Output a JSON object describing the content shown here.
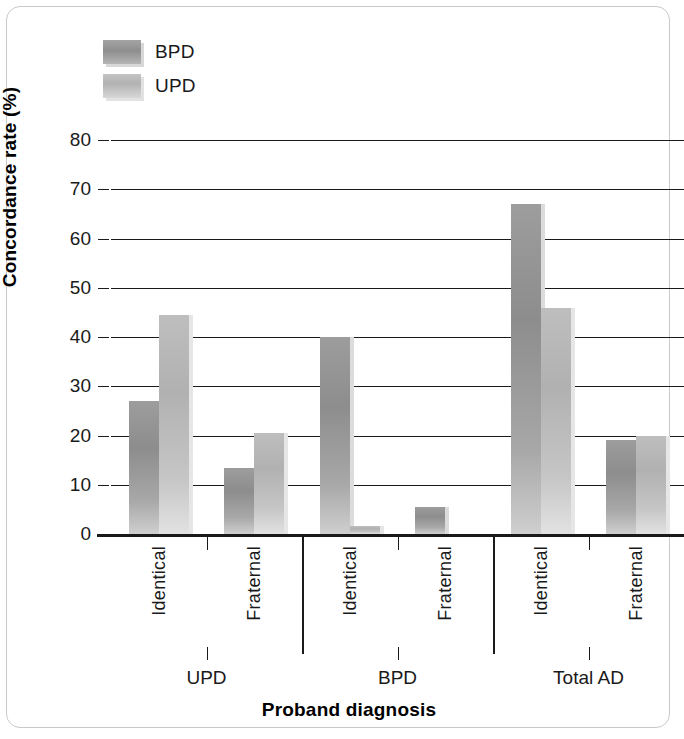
{
  "chart_data": {
    "type": "bar",
    "title": "",
    "xlabel": "Proband diagnosis",
    "ylabel": "Concordance rate (%)",
    "ylim": [
      0,
      80
    ],
    "ytick_step": 10,
    "yticks": [
      80,
      70,
      60,
      50,
      40,
      30,
      20,
      10,
      0
    ],
    "grid": true,
    "legend_position": "top-left",
    "categories": [
      "Identical",
      "Fraternal",
      "Identical",
      "Fraternal",
      "Identical",
      "Fraternal"
    ],
    "groups": [
      {
        "name": "UPD",
        "subcategories": [
          "Identical",
          "Fraternal"
        ]
      },
      {
        "name": "BPD",
        "subcategories": [
          "Identical",
          "Fraternal"
        ]
      },
      {
        "name": "Total AD",
        "subcategories": [
          "Identical",
          "Fraternal"
        ]
      }
    ],
    "series": [
      {
        "name": "BPD",
        "color": "#8d8d8d",
        "values": [
          27,
          13.5,
          40,
          5.5,
          67,
          19
        ]
      },
      {
        "name": "UPD",
        "color": "#bebebe",
        "values": [
          44.5,
          20.5,
          1.6,
          0,
          45.8,
          20
        ]
      }
    ]
  },
  "legend": {
    "items": [
      {
        "label": "BPD",
        "swatch": "legend-swatch-bpd"
      },
      {
        "label": "UPD",
        "swatch": "legend-swatch-upd"
      }
    ]
  },
  "axes": {
    "y": {
      "title": "Concordance rate (%)",
      "ticks": [
        "80",
        "70",
        "60",
        "50",
        "40",
        "30",
        "20",
        "10",
        "0"
      ]
    },
    "x": {
      "title": "Proband diagnosis",
      "sub_labels": [
        "Identical",
        "Fraternal",
        "Identical",
        "Fraternal",
        "Identical",
        "Fraternal"
      ],
      "group_labels": [
        "UPD",
        "BPD",
        "Total AD"
      ]
    }
  }
}
